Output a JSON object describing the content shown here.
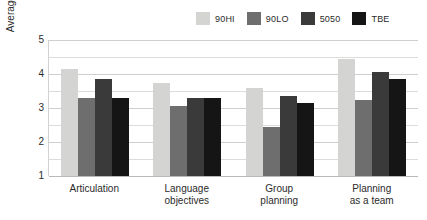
{
  "chart_data": {
    "type": "bar",
    "title": "",
    "xlabel": "",
    "ylabel": "Average score",
    "ylim": [
      1,
      5
    ],
    "y_ticks": [
      1,
      2,
      3,
      4,
      5
    ],
    "y_minor_ticks": [
      1.5,
      2.5,
      3.5,
      4.5
    ],
    "grid": true,
    "legend_position": "top-right",
    "categories": [
      "Articulation",
      "Language objectives",
      "Group planning",
      "Planning as a team"
    ],
    "category_lines": [
      [
        "Articulation"
      ],
      [
        "Language",
        "objectives"
      ],
      [
        "Group",
        "planning"
      ],
      [
        "Planning",
        "as a team"
      ]
    ],
    "series": [
      {
        "name": "90HI",
        "color": "#d4d4d2",
        "values": [
          4.15,
          3.75,
          3.6,
          4.45
        ]
      },
      {
        "name": "90LO",
        "color": "#6e6e6e",
        "values": [
          3.3,
          3.05,
          2.45,
          3.25
        ]
      },
      {
        "name": "5050",
        "color": "#3a3a3a",
        "values": [
          3.85,
          3.3,
          3.35,
          4.05
        ]
      },
      {
        "name": "TBE",
        "color": "#151515",
        "values": [
          3.3,
          3.3,
          3.15,
          3.85
        ]
      }
    ]
  },
  "colors": {
    "background": "#ffffff",
    "text": "#2b2b2b",
    "gridline": "#dcdcdc",
    "axis": "#b9b9b9"
  }
}
